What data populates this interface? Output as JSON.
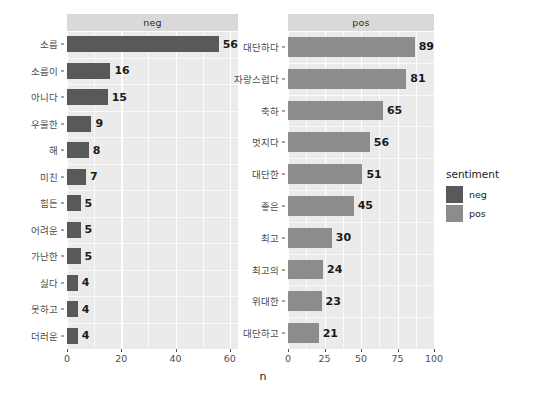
{
  "chart_data": {
    "type": "bar",
    "title": "",
    "xlabel": "n",
    "ylabel": "",
    "orientation": "horizontal",
    "grid": true,
    "facet_variable": "sentiment",
    "legend": {
      "title": "sentiment",
      "position": "right",
      "entries": [
        {
          "label": "neg",
          "color": "#595959"
        },
        {
          "label": "pos",
          "color": "#8c8c8c"
        }
      ]
    },
    "panels": [
      {
        "facet_label": "neg",
        "series_name": "neg",
        "color": "#595959",
        "xlim": [
          0,
          63
        ],
        "xticks": [
          0,
          20,
          40,
          60
        ],
        "xminor": [
          10,
          30,
          50
        ],
        "categories": [
          "소름",
          "소름이",
          "아니다",
          "우울한",
          "해",
          "미친",
          "힘든",
          "어려운",
          "가난한",
          "싫다",
          "못하고",
          "더러운"
        ],
        "values": [
          56,
          16,
          15,
          9,
          8,
          7,
          5,
          5,
          5,
          4,
          4,
          4
        ]
      },
      {
        "facet_label": "pos",
        "series_name": "pos",
        "color": "#8c8c8c",
        "xlim": [
          0,
          100
        ],
        "xticks": [
          0,
          25,
          50,
          75,
          100
        ],
        "xminor": [
          12.5,
          37.5,
          62.5,
          87.5
        ],
        "categories": [
          "대단하다",
          "자랑스럽다",
          "축하",
          "멋지다",
          "대단한",
          "좋은",
          "최고",
          "최고의",
          "위대한",
          "대단하고"
        ],
        "values": [
          89,
          81,
          65,
          56,
          51,
          45,
          30,
          24,
          23,
          21
        ]
      }
    ]
  },
  "theme": {
    "panel_background": "#ebebeb",
    "strip_background": "#d9d9d9",
    "gridline_color": "#ffffff",
    "axis_text_color": "#4d4d4d",
    "value_label_color": "#1a1a1a",
    "page_background": "#ffffff"
  }
}
